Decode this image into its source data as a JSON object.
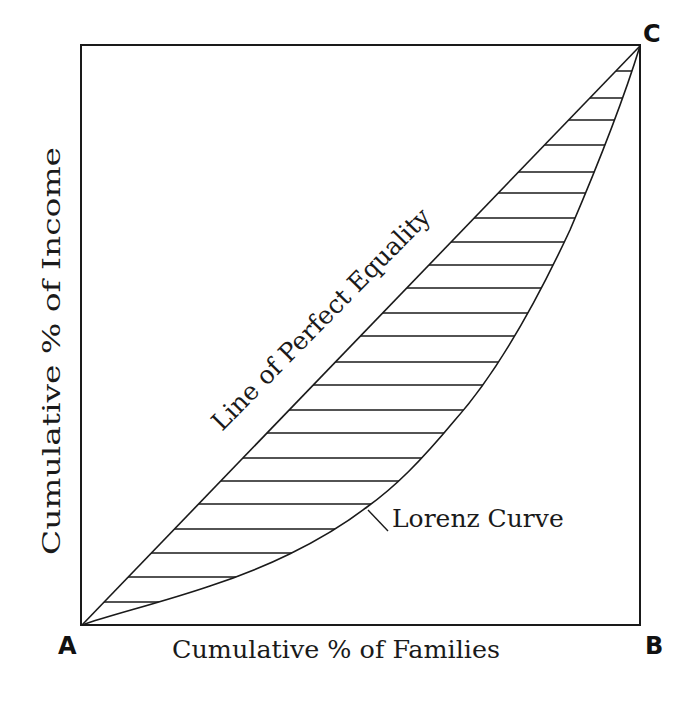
{
  "chart_data": {
    "type": "line",
    "xlabel": "Cumulative % of Families",
    "ylabel": "Cumulative % of Income",
    "xlim": [
      0,
      100
    ],
    "ylim": [
      0,
      100
    ],
    "grid": false,
    "legend": null,
    "corner_labels": {
      "origin": "A",
      "bottom_right": "B",
      "top_right": "C"
    },
    "series": [
      {
        "name": "Line of Perfect Equality",
        "x": [
          0,
          100
        ],
        "y": [
          0,
          100
        ]
      },
      {
        "name": "Lorenz Curve",
        "x": [
          0,
          23,
          39,
          51,
          64,
          80,
          90,
          96,
          100
        ],
        "y": [
          0,
          8,
          15,
          25,
          39,
          58,
          75,
          87,
          100
        ]
      }
    ],
    "annotations": [
      {
        "text": "Line of Perfect Equality",
        "position": "along diagonal A–C"
      },
      {
        "text": "Lorenz Curve",
        "position": "callout to curve near (51, 25)"
      },
      {
        "text": "hatched area between diagonal and Lorenz curve",
        "position": "region between curves"
      }
    ]
  },
  "labels": {
    "y_axis": "Cumulative % of Income",
    "x_axis": "Cumulative % of Families",
    "diagonal": "Line of Perfect Equality",
    "curve": "Lorenz Curve",
    "corner_a": "A",
    "corner_b": "B",
    "corner_c": "C"
  },
  "colors": {
    "stroke": "#1a1a1a",
    "background": "#ffffff"
  },
  "hatch_y": [
    71,
    98,
    120,
    145,
    172,
    193,
    218,
    242,
    265,
    288,
    313,
    336,
    362,
    385,
    410,
    433,
    458,
    481,
    504,
    529,
    553,
    577,
    602
  ]
}
